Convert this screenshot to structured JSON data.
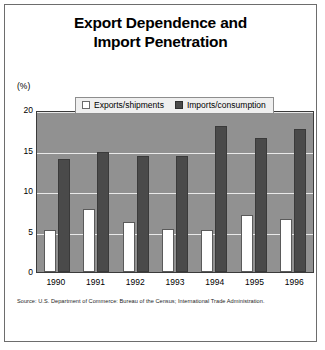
{
  "figure": {
    "title_line1": "Export Dependence and",
    "title_line2": "Import Penetration",
    "axis_unit": "(%)",
    "source": "Source: U.S. Department of Commerce: Bureau of the Census; International Trade Administration."
  },
  "colors": {
    "plot_background": "#919191",
    "gridline": "#e9e9e9",
    "exports_bar": "#ffffff",
    "imports_bar": "#4a4a4a",
    "border": "#3b3b3b",
    "legend_background": "#efefef"
  },
  "chart_data": {
    "type": "bar",
    "title": "Export Dependence and Import Penetration",
    "xlabel": "",
    "ylabel": "(%)",
    "ylim": [
      0,
      20
    ],
    "yticks": [
      "0",
      "5",
      "10",
      "15",
      "20"
    ],
    "ytick_values": [
      0,
      5,
      10,
      15,
      20
    ],
    "grid": true,
    "legend_position": "top-center",
    "categories": [
      "1990",
      "1991",
      "1992",
      "1993",
      "1994",
      "1995",
      "1996"
    ],
    "series": [
      {
        "name": "Exports/shipments",
        "color": "#ffffff",
        "values": [
          5.2,
          7.8,
          6.2,
          5.3,
          5.2,
          7.1,
          6.6
        ]
      },
      {
        "name": "Imports/consumption",
        "color": "#4a4a4a",
        "values": [
          14.0,
          14.8,
          14.3,
          14.3,
          18.0,
          16.5,
          17.7
        ]
      }
    ]
  }
}
